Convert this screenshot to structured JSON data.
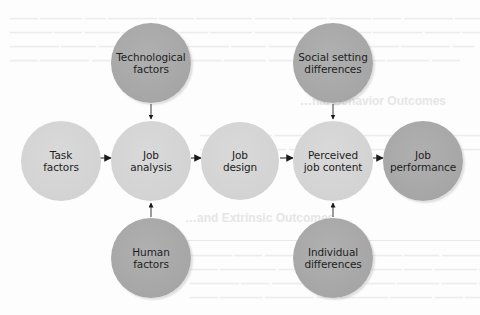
{
  "diagram": {
    "type": "flow",
    "direction": "left-to-right",
    "nodes": [
      {
        "id": "technological-factors",
        "label": "Technological\nfactors",
        "shade": "dark",
        "cx": 151,
        "cy": 63,
        "r": 40
      },
      {
        "id": "social-setting-differences",
        "label": "Social setting\ndifferences",
        "shade": "dark",
        "cx": 333,
        "cy": 63,
        "r": 40
      },
      {
        "id": "task-factors",
        "label": "Task\nfactors",
        "shade": "light",
        "cx": 61,
        "cy": 161,
        "r": 40
      },
      {
        "id": "job-analysis",
        "label": "Job\nanalysis",
        "shade": "light",
        "cx": 151,
        "cy": 161,
        "r": 40
      },
      {
        "id": "job-design",
        "label": "Job\ndesign",
        "shade": "light",
        "cx": 240,
        "cy": 161,
        "r": 39
      },
      {
        "id": "perceived-job-content",
        "label": "Perceived\njob content",
        "shade": "light",
        "cx": 333,
        "cy": 161,
        "r": 40
      },
      {
        "id": "job-performance",
        "label": "Job\nperformance",
        "shade": "dark",
        "cx": 423,
        "cy": 161,
        "r": 40
      },
      {
        "id": "human-factors",
        "label": "Human\nfactors",
        "shade": "dark",
        "cx": 151,
        "cy": 258,
        "r": 40
      },
      {
        "id": "individual-differences",
        "label": "Individual\ndifferences",
        "shade": "dark",
        "cx": 333,
        "cy": 258,
        "r": 40
      }
    ],
    "edges": [
      {
        "from": "technological-factors",
        "to": "job-analysis"
      },
      {
        "from": "human-factors",
        "to": "job-analysis"
      },
      {
        "from": "task-factors",
        "to": "job-analysis"
      },
      {
        "from": "job-analysis",
        "to": "job-design"
      },
      {
        "from": "job-design",
        "to": "perceived-job-content"
      },
      {
        "from": "social-setting-differences",
        "to": "perceived-job-content"
      },
      {
        "from": "individual-differences",
        "to": "perceived-job-content"
      },
      {
        "from": "perceived-job-content",
        "to": "job-performance"
      }
    ]
  },
  "colors": {
    "dark_node": "#a9a9a9",
    "light_node": "#d4d4d4",
    "text": "#1e1e1e",
    "arrow_head": "#1a1a1a",
    "arrow_shaft": "#5a5a5a",
    "background": "#fdfdfd"
  },
  "background_bleed": {
    "heading_1": "…nal Behavior Outcomes",
    "heading_2": "…and Extrinsic Outcomes"
  }
}
